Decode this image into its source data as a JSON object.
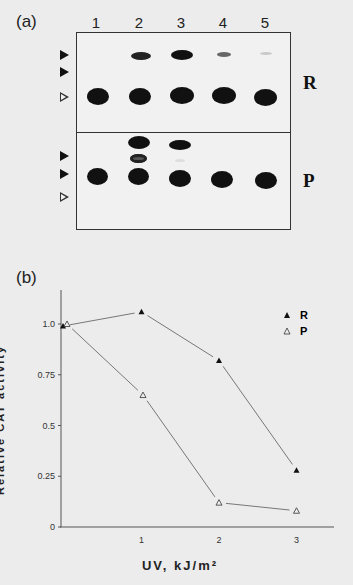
{
  "panel_a": {
    "label": "(a)",
    "lanes": [
      "1",
      "2",
      "3",
      "4",
      "5"
    ],
    "rows": [
      {
        "label": "R",
        "markers": [
          "filled-arrow",
          "filled-arrow",
          "open-arrow"
        ]
      },
      {
        "label": "P",
        "markers": [
          "filled-arrow",
          "filled-arrow",
          "open-arrow"
        ]
      }
    ]
  },
  "panel_b": {
    "label": "(b)"
  },
  "chart_data": {
    "type": "line",
    "title": "",
    "xlabel": "UV, kJ/m²",
    "ylabel": "Relative CAT activity",
    "xlim": [
      0,
      3.5
    ],
    "ylim": [
      0,
      1.15
    ],
    "x_ticks": [
      "1",
      "2",
      "3"
    ],
    "y_ticks": [
      "0",
      "0.25",
      "0.5",
      "0.75",
      "1.0"
    ],
    "grid": false,
    "legend_position": "upper right",
    "series": [
      {
        "name": "R",
        "marker": "filled-triangle",
        "x": [
          0,
          1,
          2,
          3
        ],
        "values": [
          0.99,
          1.06,
          0.82,
          0.28
        ]
      },
      {
        "name": "P",
        "marker": "open-triangle",
        "x": [
          0,
          1,
          2,
          3
        ],
        "values": [
          1.0,
          0.65,
          0.12,
          0.08
        ]
      }
    ]
  }
}
